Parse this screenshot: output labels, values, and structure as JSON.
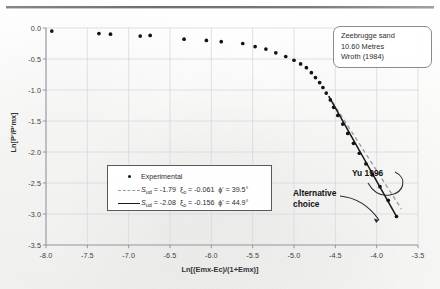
{
  "chart_data": {
    "type": "scatter",
    "title": "",
    "xlabel": "Ln[(Emx-Ec)/(1+Emx)]",
    "ylabel": "Ln[P'/P'mx]",
    "xlim": [
      -8.0,
      -3.5
    ],
    "ylim": [
      -3.5,
      0.0
    ],
    "xticks": [
      "-8.0",
      "-7.5",
      "-7.0",
      "-6.5",
      "-6.0",
      "-5.5",
      "-5.0",
      "-4.5",
      "-4.0",
      "-3.5"
    ],
    "yticks": [
      "0.0",
      "-0.5",
      "-1.0",
      "-1.5",
      "-2.0",
      "-2.5",
      "-3.0",
      "-3.5"
    ],
    "grid": true,
    "legend_position": "inside-lower-left",
    "series": [
      {
        "name": "Experimental",
        "type": "scatter",
        "marker": "filled-circle",
        "color": "#141414",
        "points": [
          [
            -7.93,
            -0.05
          ],
          [
            -7.36,
            -0.09
          ],
          [
            -7.22,
            -0.1
          ],
          [
            -6.86,
            -0.13
          ],
          [
            -6.74,
            -0.12
          ],
          [
            -6.33,
            -0.18
          ],
          [
            -6.06,
            -0.2
          ],
          [
            -5.88,
            -0.22
          ],
          [
            -5.62,
            -0.25
          ],
          [
            -5.47,
            -0.3
          ],
          [
            -5.34,
            -0.34
          ],
          [
            -5.22,
            -0.4
          ],
          [
            -5.1,
            -0.46
          ],
          [
            -5.0,
            -0.52
          ],
          [
            -4.92,
            -0.58
          ],
          [
            -4.85,
            -0.64
          ],
          [
            -4.79,
            -0.72
          ],
          [
            -4.74,
            -0.8
          ],
          [
            -4.69,
            -0.88
          ],
          [
            -4.65,
            -0.96
          ],
          [
            -4.61,
            -1.05
          ],
          [
            -4.56,
            -1.16
          ],
          [
            -4.52,
            -1.28
          ],
          [
            -4.47,
            -1.41
          ],
          [
            -4.41,
            -1.55
          ],
          [
            -4.35,
            -1.7
          ],
          [
            -4.28,
            -1.86
          ],
          [
            -4.21,
            -2.02
          ],
          [
            -4.13,
            -2.19
          ],
          [
            -4.05,
            -2.37
          ],
          [
            -3.96,
            -2.56
          ],
          [
            -3.86,
            -2.78
          ],
          [
            -3.76,
            -3.04
          ]
        ]
      },
      {
        "name": "fit-dashed",
        "type": "line",
        "style": "dashed",
        "color": "#9a9a9a",
        "label_sud": "-1.79",
        "label_xi": "-0.061",
        "label_phi": "39.5",
        "points": [
          [
            -4.58,
            -1.1
          ],
          [
            -3.7,
            -2.92
          ]
        ]
      },
      {
        "name": "fit-solid",
        "type": "line",
        "style": "solid",
        "color": "#1a1a1a",
        "label_sud": "-2.08",
        "label_xi": "-0.156",
        "label_phi": "44.9",
        "points": [
          [
            -4.58,
            -1.1
          ],
          [
            -3.755,
            -3.05
          ]
        ]
      }
    ],
    "annotations": [
      {
        "name": "note-box",
        "lines": [
          "Zeebrugge sand",
          "10.60 Metres",
          "Wroth (1984)"
        ]
      },
      {
        "name": "yu-1996",
        "text": "Yu 1996"
      },
      {
        "name": "alternative-choice",
        "text": "Alternative choice"
      }
    ]
  },
  "note": {
    "line1": "Zeebrugge sand",
    "line2": "10.60 Metres",
    "line3": "Wroth (1984)"
  },
  "annotations": {
    "yu": "Yu 1996",
    "alt_line1": "Alternative",
    "alt_line2": "choice"
  },
  "legend": {
    "experimental": "Experimental",
    "row2": {
      "sud_name": "S",
      "sud_sub": "ud",
      "sud_eq": " = -1.79",
      "xi_name": "ξ",
      "xi_sub": "o",
      "xi_eq": " = -0.061",
      "phi_name": "ϕ'",
      "phi_eq": " = 39.5°"
    },
    "row3": {
      "sud_name": "S",
      "sud_sub": "ud",
      "sud_eq": " = -2.08",
      "xi_name": "ξ",
      "xi_sub": "o",
      "xi_eq": " = -0.156",
      "phi_name": "ϕ'",
      "phi_eq": " = 44.9°"
    }
  },
  "axes": {
    "xlabel": "Ln[(Emx-Ec)/(1+Emx)]",
    "ylabel": "Ln[P'/P'mx]",
    "xticks": [
      "-8.0",
      "-7.5",
      "-7.0",
      "-6.5",
      "-6.0",
      "-5.5",
      "-5.0",
      "-4.5",
      "-4.0",
      "-3.5"
    ],
    "yticks": [
      "0.0",
      "-0.5",
      "-1.0",
      "-1.5",
      "-2.0",
      "-2.5",
      "-3.0",
      "-3.5"
    ]
  }
}
